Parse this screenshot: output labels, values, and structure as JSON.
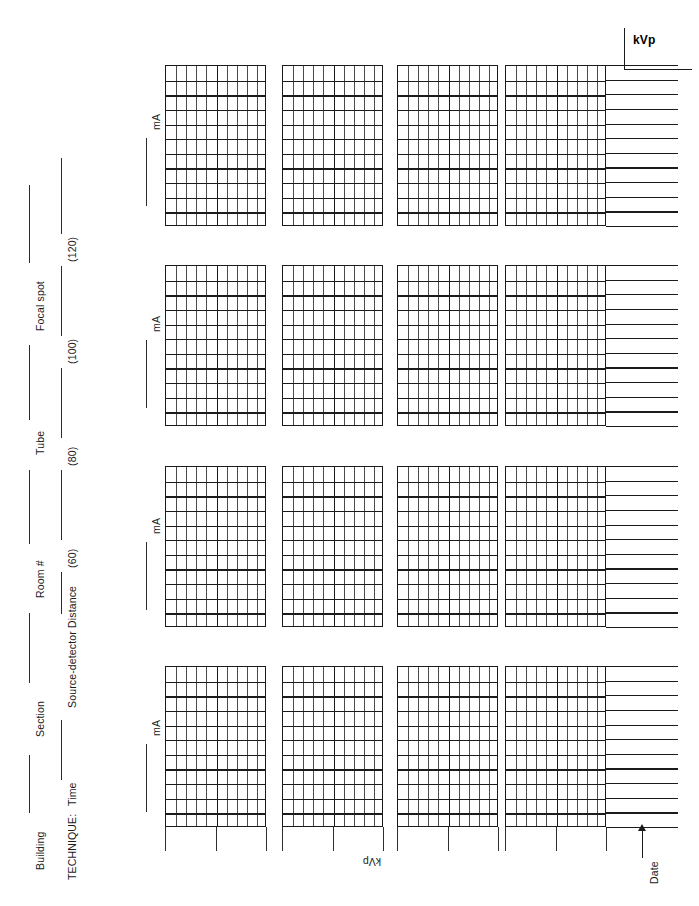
{
  "form": {
    "title": "Radiographic Technique Chart",
    "orientation": "landscape-rotated"
  },
  "header_rows": [
    {
      "id": "row-1",
      "fields": [
        {
          "label": "Building",
          "name": "building"
        },
        {
          "label": "Section",
          "name": "section"
        },
        {
          "label": "Room #",
          "name": "room-number"
        },
        {
          "label": "Tube",
          "name": "tube"
        },
        {
          "label": "Focal spot",
          "name": "focal-spot"
        }
      ]
    },
    {
      "id": "row-2",
      "prefix": "TECHNIQUE:",
      "fields": [
        {
          "label": "Time",
          "name": "time"
        },
        {
          "label": "Source-detector Distance",
          "name": "source-detector-distance"
        },
        {
          "label": "(60)",
          "name": "kvp-60"
        },
        {
          "label": "(80)",
          "name": "kvp-80"
        },
        {
          "label": "(100)",
          "name": "kvp-100"
        },
        {
          "label": "(120)",
          "name": "kvp-120"
        }
      ]
    }
  ],
  "axes": {
    "kvp_top_label": "kVp",
    "kvp_bottom_label": "kVp",
    "ma_label": "mA",
    "date_label": "Date"
  },
  "chart_data": {
    "type": "table",
    "xlabel": "kVp",
    "ylabel": "mA",
    "grid": true,
    "legend": "none",
    "rows": 4,
    "columns": 4,
    "block_grid": {
      "columns": 10,
      "rows": 11,
      "major_column_after": 5
    },
    "kvp_settings": [
      60,
      80,
      100,
      120
    ],
    "ma_row_labels": [
      "mA",
      "mA",
      "mA",
      "mA"
    ],
    "extension_lines_per_row": 11,
    "ticks_below_block": 3,
    "values": []
  }
}
